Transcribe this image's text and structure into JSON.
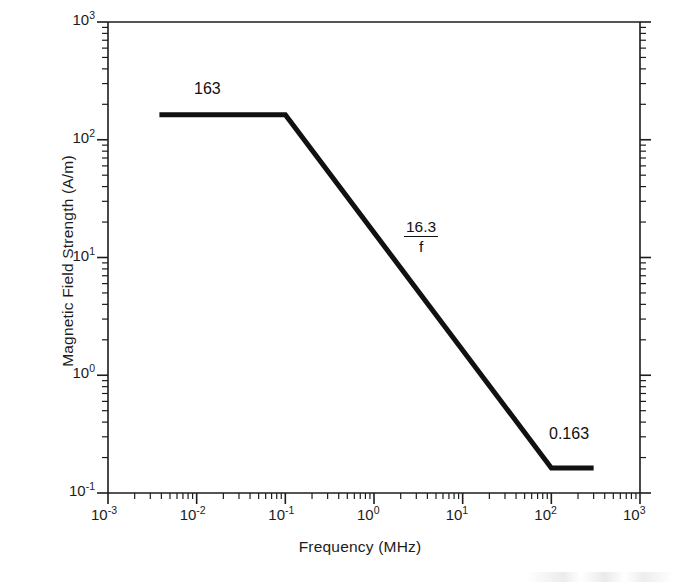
{
  "chart_data": {
    "type": "line",
    "title": "",
    "xlabel": "Frequency (MHz)",
    "ylabel": "Magnetic Field Strength (A/m)",
    "xscale": "log",
    "yscale": "log",
    "xlim": [
      0.001,
      1000
    ],
    "ylim": [
      0.1,
      1000
    ],
    "grid": false,
    "legend": "none",
    "xticks": [
      {
        "value": 0.001,
        "mantissa": "10",
        "exponent": "-3"
      },
      {
        "value": 0.01,
        "mantissa": "10",
        "exponent": "-2"
      },
      {
        "value": 0.1,
        "mantissa": "10",
        "exponent": "-1"
      },
      {
        "value": 1,
        "mantissa": "10",
        "exponent": "0"
      },
      {
        "value": 10,
        "mantissa": "10",
        "exponent": "1"
      },
      {
        "value": 100,
        "mantissa": "10",
        "exponent": "2"
      },
      {
        "value": 1000,
        "mantissa": "10",
        "exponent": "3"
      }
    ],
    "yticks": [
      {
        "value": 1000,
        "mantissa": "10",
        "exponent": "3"
      },
      {
        "value": 100,
        "mantissa": "10",
        "exponent": "2"
      },
      {
        "value": 10,
        "mantissa": "10",
        "exponent": "1"
      },
      {
        "value": 1,
        "mantissa": "10",
        "exponent": "0"
      },
      {
        "value": 0.1,
        "mantissa": "10",
        "exponent": "-1"
      }
    ],
    "series": [
      {
        "name": "Magnetic field strength limit",
        "color": "#111111",
        "linewidth": 5,
        "points": [
          {
            "x": 0.0038,
            "y": 163
          },
          {
            "x": 0.1,
            "y": 163
          },
          {
            "x": 100,
            "y": 0.163
          },
          {
            "x": 300,
            "y": 0.163
          }
        ]
      }
    ],
    "annotations": [
      {
        "name": "plateau-low-value",
        "text": "163",
        "x": 0.016,
        "y": 330
      },
      {
        "name": "slope-formula-numerator",
        "text": "16.3",
        "x": 2.4,
        "y": 24
      },
      {
        "name": "slope-formula-denominator",
        "text": "f",
        "x": 2.4,
        "y": 16
      },
      {
        "name": "plateau-high-value",
        "text": "0.163",
        "x": 160,
        "y": 0.37
      }
    ]
  },
  "chart": {
    "xlabel": "Frequency (MHz)",
    "ylabel": "Magnetic Field Strength (A/m)",
    "annotation_plateau_low": "163",
    "annotation_formula_numerator": "16.3",
    "annotation_formula_denominator": "f",
    "annotation_plateau_high": "0.163",
    "xtick_labels": [
      "10",
      "10",
      "10",
      "10",
      "10",
      "10",
      "10"
    ],
    "xtick_exponents": [
      "-3",
      "-2",
      "-1",
      "0",
      "1",
      "2",
      "3"
    ],
    "ytick_labels": [
      "10",
      "10",
      "10",
      "10",
      "10"
    ],
    "ytick_exponents": [
      "3",
      "2",
      "1",
      "0",
      "-1"
    ],
    "line_color": "#111111",
    "axis_color": "#1c1c1c"
  }
}
